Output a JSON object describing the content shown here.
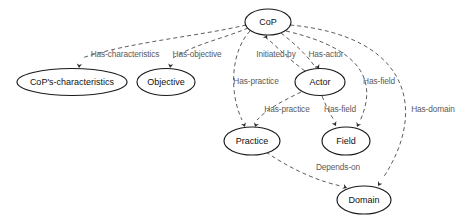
{
  "diagram": {
    "type": "ontology-graph",
    "title": "",
    "nodes": [
      {
        "id": "cop",
        "label": "CoP",
        "cx": 268,
        "cy": 22,
        "rx": 23,
        "ry": 13
      },
      {
        "id": "characteristics",
        "label": "CoP's-characteristics",
        "cx": 72,
        "cy": 82,
        "rx": 55,
        "ry": 13.5
      },
      {
        "id": "objective",
        "label": "Objective",
        "cx": 166,
        "cy": 82,
        "rx": 29,
        "ry": 13.5
      },
      {
        "id": "actor",
        "label": "Actor",
        "cx": 320,
        "cy": 82,
        "rx": 25,
        "ry": 13.5
      },
      {
        "id": "practice",
        "label": "Practice",
        "cx": 252,
        "cy": 141,
        "rx": 28,
        "ry": 14
      },
      {
        "id": "field",
        "label": "Field",
        "cx": 346,
        "cy": 141,
        "rx": 24,
        "ry": 14
      },
      {
        "id": "domain",
        "label": "Domain",
        "cx": 364,
        "cy": 200,
        "rx": 27,
        "ry": 14
      }
    ],
    "edges": [
      {
        "id": "has-characteristics",
        "label": "Has-characteristics",
        "from": "cop",
        "to": "characteristics",
        "label_x": 125,
        "label_y": 55,
        "path": "M 246 25 C 200 36 130 42 82 58",
        "arrow_x": 79,
        "arrow_y": 68,
        "arrow_dir": 95
      },
      {
        "id": "has-objective",
        "label": "Has-objective",
        "from": "cop",
        "to": "objective",
        "label_x": 197,
        "label_y": 55,
        "path": "M 248 28 C 225 38 195 44 173 58",
        "arrow_x": 170,
        "arrow_y": 68,
        "arrow_dir": 100
      },
      {
        "id": "initiated-by",
        "label": "Initiated-by",
        "from": "actor",
        "to": "cop",
        "label_x": 276,
        "label_y": 55,
        "path": "M 305 71 C 290 60 280 50 269 40",
        "arrow_x": 267,
        "arrow_y": 35,
        "arrow_dir": -65
      },
      {
        "id": "has-actor",
        "label": "Has-actor",
        "from": "cop",
        "to": "actor",
        "label_x": 326,
        "label_y": 55,
        "path": "M 281 33 C 295 44 306 54 316 68",
        "arrow_x": 319,
        "arrow_y": 69,
        "arrow_dir": 62
      },
      {
        "id": "has-practice-cop",
        "label": "Has-practice",
        "from": "cop",
        "to": "practice",
        "label_x": 256,
        "label_y": 82,
        "path": "M 250 31 C 232 50 228 90 242 120",
        "arrow_x": 245,
        "arrow_y": 127,
        "arrow_dir": 68
      },
      {
        "id": "has-practice-actor",
        "label": "Has-practice",
        "from": "actor",
        "to": "practice",
        "label_x": 287,
        "label_y": 110,
        "path": "M 301 92 C 285 100 268 108 257 120",
        "arrow_x": 255,
        "arrow_y": 127,
        "arrow_dir": 110
      },
      {
        "id": "has-field-actor",
        "label": "Has-field",
        "from": "actor",
        "to": "field",
        "label_x": 340,
        "label_y": 110,
        "path": "M 322 96 C 326 106 330 114 334 120",
        "arrow_x": 336,
        "arrow_y": 126,
        "arrow_dir": 62
      },
      {
        "id": "has-field-cop",
        "label": "Has-field",
        "from": "cop",
        "to": "field",
        "label_x": 379,
        "label_y": 82,
        "path": "M 286 31 C 368 50 376 85 360 121",
        "arrow_x": 357,
        "arrow_y": 127,
        "arrow_dir": 115
      },
      {
        "id": "has-domain",
        "label": "Has-domain",
        "from": "cop",
        "to": "domain",
        "label_x": 433,
        "label_y": 110,
        "path": "M 290 25 C 410 36 428 110 383 178",
        "arrow_x": 378,
        "arrow_y": 186,
        "arrow_dir": 122
      },
      {
        "id": "depends-on",
        "label": "Depends-on",
        "from": "practice",
        "to": "domain",
        "label_x": 338,
        "label_y": 168,
        "path": "M 266 152 C 295 172 322 182 341 186",
        "arrow_x": 347,
        "arrow_y": 188,
        "arrow_dir": 22
      }
    ]
  }
}
